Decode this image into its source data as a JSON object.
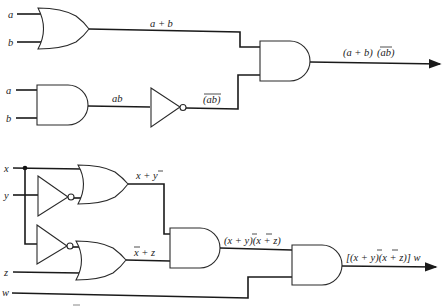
{
  "diagram": {
    "type": "logic-circuit",
    "top_circuit": {
      "inputs": [
        "a",
        "b",
        "a",
        "b"
      ],
      "gates": [
        {
          "id": "or1",
          "type": "OR",
          "inputs": [
            "a",
            "b"
          ],
          "output_label": "a + b"
        },
        {
          "id": "and1",
          "type": "AND",
          "inputs": [
            "a",
            "b"
          ],
          "output_label": "ab"
        },
        {
          "id": "not1",
          "type": "NOT",
          "inputs": [
            "ab"
          ],
          "output_label": "(ab)"
        },
        {
          "id": "and2",
          "type": "AND",
          "inputs": [
            "a + b",
            "(ab)'"
          ],
          "output_label": "(a + b)(ab)"
        }
      ],
      "labels": {
        "in_a1": "a",
        "in_b1": "b",
        "in_a2": "a",
        "in_b2": "b",
        "or_out": "a + b",
        "and_out": "ab",
        "not_out": "(ab)",
        "final_prefix": "(a + b)",
        "final_overbar": "(ab)"
      }
    },
    "bottom_circuit": {
      "inputs": [
        "x",
        "y",
        "z",
        "w"
      ],
      "gates": [
        {
          "id": "not2",
          "type": "NOT",
          "inputs": [
            "y"
          ],
          "output_label": "y'"
        },
        {
          "id": "or3",
          "type": "OR",
          "inputs": [
            "x",
            "y'"
          ],
          "output_label": "x + y'"
        },
        {
          "id": "not3",
          "type": "NOT",
          "inputs": [
            "x"
          ],
          "output_label": "x'"
        },
        {
          "id": "or4",
          "type": "OR",
          "inputs": [
            "x'",
            "z"
          ],
          "output_label": "x' + z"
        },
        {
          "id": "and3",
          "type": "AND",
          "inputs": [
            "x + y'",
            "x' + z"
          ],
          "output_label": "(x + y')(x' + z)"
        },
        {
          "id": "and4",
          "type": "AND",
          "inputs": [
            "(x + y')(x' + z)",
            "w"
          ],
          "output_label": "[(x + y')(x' + z)] w"
        }
      ],
      "labels": {
        "in_x": "x",
        "in_y": "y",
        "in_z": "z",
        "in_w": "w",
        "or3_out": "x + y",
        "or4_out": "x + z",
        "and3_out": "(x + y)(x + z)",
        "final": "[(x + y)(x + z)] w"
      }
    }
  }
}
